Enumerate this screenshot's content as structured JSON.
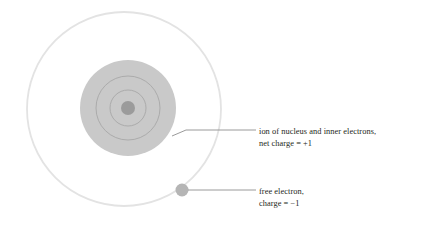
{
  "figure": {
    "type": "diagram",
    "background_color": "#ffffff",
    "width": 428,
    "height": 227,
    "colors": {
      "outer_orbit_stroke": "#e2e2e2",
      "ion_disk_fill": "#c9c9c9",
      "inner_ring_stroke": "#a9a9a9",
      "nucleus_fill": "#9b9b9b",
      "free_electron_fill": "#b4b4b4",
      "leader_line": "#8f8f8f",
      "text": "#231f20"
    },
    "shapes": {
      "outer_orbit": {
        "cx": 124,
        "cy": 109,
        "r": 97,
        "stroke_width": 1.6,
        "filled": false
      },
      "ion_disk": {
        "cx": 128,
        "cy": 108,
        "r": 48,
        "filled": true
      },
      "inner_ring_outer": {
        "cx": 128,
        "cy": 108,
        "r": 32,
        "stroke_width": 1,
        "filled": false
      },
      "inner_ring_middle": {
        "cx": 128,
        "cy": 108,
        "r": 18,
        "stroke_width": 1,
        "filled": false
      },
      "nucleus": {
        "cx": 128,
        "cy": 108,
        "r": 7,
        "filled": true
      },
      "free_electron": {
        "cx": 182,
        "cy": 190,
        "r": 6.5,
        "filled": true
      }
    },
    "leaders": [
      {
        "name": "leader-ion",
        "from_x": 172,
        "from_y": 133,
        "to_x": 256,
        "to_y": 133
      },
      {
        "name": "leader-electron",
        "from_x": 189,
        "from_y": 190,
        "to_x": 256,
        "to_y": 190
      }
    ]
  },
  "labels": {
    "ion": {
      "line1": "ion of nucleus and inner electrons,",
      "line2": "net charge = +1"
    },
    "electron": {
      "line1": "free electron,",
      "line2": "charge = −1"
    }
  }
}
